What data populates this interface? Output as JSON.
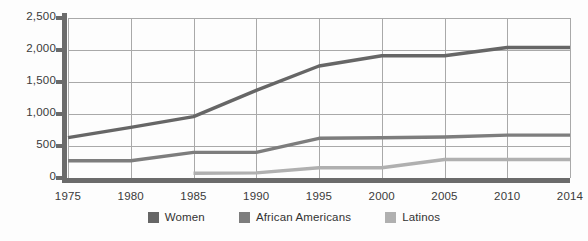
{
  "chart_data": {
    "type": "line",
    "title": "",
    "subtitle": "",
    "xlabel": "",
    "ylabel": "",
    "x": [
      1975,
      1980,
      1985,
      1990,
      1995,
      2000,
      2005,
      2010,
      2014
    ],
    "categories": [
      "1975",
      "1980",
      "1985",
      "1990",
      "1995",
      "2000",
      "2005",
      "2010",
      "2014"
    ],
    "ylim": [
      0,
      2500
    ],
    "yticks": [
      0,
      500,
      1000,
      1500,
      2000,
      2500
    ],
    "ytick_labels": [
      "0",
      "500",
      "1,000",
      "1,500",
      "2,000",
      "2,500"
    ],
    "grid": true,
    "legend_position": "bottom",
    "series": [
      {
        "name": "Women",
        "color": "#666666",
        "values": [
          630,
          790,
          960,
          1370,
          1750,
          1910,
          1910,
          2040,
          2040
        ]
      },
      {
        "name": "African Americans",
        "color": "#7d7d7d",
        "values": [
          270,
          270,
          400,
          400,
          620,
          630,
          640,
          670,
          670
        ]
      },
      {
        "name": "Latinos",
        "color": "#b0b0b0",
        "values": [
          null,
          null,
          75,
          80,
          160,
          160,
          290,
          290,
          290
        ]
      }
    ]
  },
  "legend": {
    "items": [
      {
        "label": "Women",
        "color": "#666666"
      },
      {
        "label": "African Americans",
        "color": "#7d7d7d"
      },
      {
        "label": "Latinos",
        "color": "#b0b0b0"
      }
    ]
  },
  "axis": {
    "y_tick_labels": [
      "2,500",
      "2,000",
      "1,500",
      "1,000",
      "500",
      "0"
    ],
    "x_tick_labels": [
      "1975",
      "1980",
      "1985",
      "1990",
      "1995",
      "2000",
      "2005",
      "2010",
      "2014"
    ]
  },
  "colors": {
    "grid": "#a9a9a9",
    "axis": "#6b6b6b",
    "text": "#3a3a3a",
    "background": "#fdfdfd"
  }
}
